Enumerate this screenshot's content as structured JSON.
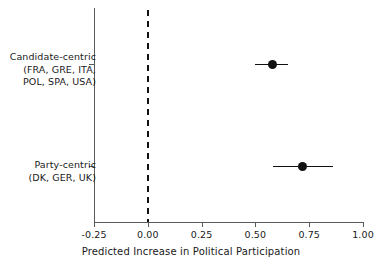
{
  "chart_data": {
    "type": "scatter",
    "title": "",
    "xlabel": "Predicted Increase in Political Participation",
    "ylabel": "",
    "xlim": [
      -0.25,
      1.0
    ],
    "xticks": [
      "-0.25",
      "0.00",
      "0.25",
      "0.50",
      "0.75",
      "1.00"
    ],
    "xtick_values": [
      -0.25,
      0.0,
      0.25,
      0.5,
      0.75,
      1.0
    ],
    "grid": false,
    "legend": null,
    "reference_line": {
      "x": 0.0,
      "style": "dashed",
      "color": "#111111"
    },
    "categories": [
      {
        "label_line1": "Candidate-centric",
        "label_line2": "(FRA, GRE, ITA,",
        "label_line3": "POL, SPA, USA)",
        "estimate": 0.58,
        "ci_low": 0.5,
        "ci_high": 0.65
      },
      {
        "label_line1": "Party-centric",
        "label_line2": "(DK, GER, UK)",
        "label_line3": "",
        "estimate": 0.72,
        "ci_low": 0.58,
        "ci_high": 0.86
      }
    ],
    "colors": {
      "point": "#111111",
      "ci": "#111111",
      "axis": "#5a5a5a",
      "background": "#ffffff"
    }
  }
}
